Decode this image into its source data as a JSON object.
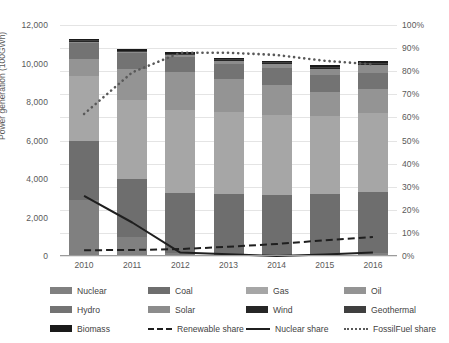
{
  "chart_data": {
    "type": "bar",
    "title": "",
    "subtitle": "",
    "xlabel": "",
    "ylabel": "Power generation (100GWh)",
    "y2label": "",
    "categories": [
      "2010",
      "2011",
      "2012",
      "2013",
      "2014",
      "2015",
      "2016"
    ],
    "ylim": [
      0,
      12000
    ],
    "yticks": [
      "0",
      "2,000",
      "4,000",
      "6,000",
      "8,000",
      "10,000",
      "12,000"
    ],
    "ytick_values": [
      0,
      2000,
      4000,
      6000,
      8000,
      10000,
      12000
    ],
    "y2lim": [
      0,
      100
    ],
    "y2ticks": [
      "0%",
      "10%",
      "20%",
      "30%",
      "40%",
      "50%",
      "60%",
      "70%",
      "80%",
      "90%",
      "100%"
    ],
    "y2tick_values": [
      0,
      10,
      20,
      30,
      40,
      50,
      60,
      70,
      80,
      90,
      100
    ],
    "grid": true,
    "legend_position": "bottom",
    "stacked": true,
    "series": [
      {
        "name": "Nuclear",
        "color": "#808080",
        "values": [
          2900,
          1000,
          150,
          90,
          0,
          90,
          180
        ]
      },
      {
        "name": "Coal",
        "color": "#6e6e6e",
        "values": [
          3050,
          3000,
          3100,
          3150,
          3150,
          3150,
          3150
        ]
      },
      {
        "name": "Gas",
        "color": "#a6a6a6",
        "values": [
          3400,
          4100,
          4350,
          4250,
          4200,
          4050,
          4100
        ]
      },
      {
        "name": "Oil",
        "color": "#949494",
        "values": [
          900,
          1600,
          1950,
          1700,
          1550,
          1250,
          1250
        ]
      },
      {
        "name": "Hydro",
        "color": "#737373",
        "values": [
          850,
          850,
          800,
          800,
          850,
          870,
          850
        ]
      },
      {
        "name": "Solar",
        "color": "#8c8c8c",
        "values": [
          35,
          50,
          80,
          150,
          230,
          320,
          400
        ]
      },
      {
        "name": "Wind",
        "color": "#262626",
        "values": [
          40,
          45,
          50,
          52,
          55,
          58,
          62
        ]
      },
      {
        "name": "Geothermal",
        "color": "#3f3f3f",
        "values": [
          26,
          27,
          26,
          26,
          26,
          26,
          26
        ]
      },
      {
        "name": "Biomass",
        "color": "#1a1a1a",
        "values": [
          60,
          65,
          70,
          75,
          80,
          85,
          90
        ]
      }
    ],
    "line_series": [
      {
        "name": "Renewable share",
        "style": "dashed",
        "color": "#1f1f1f",
        "unit": "%",
        "values": [
          2.5,
          2.6,
          3.0,
          4.0,
          5.2,
          6.8,
          8.2
        ]
      },
      {
        "name": "Nuclear share",
        "style": "solid",
        "color": "#1f1f1f",
        "unit": "%",
        "values": [
          26.0,
          14.5,
          1.5,
          0.8,
          0.0,
          0.6,
          1.5
        ]
      },
      {
        "name": "FossilFuel share",
        "style": "dotted",
        "color": "#595959",
        "unit": "%",
        "values": [
          61.5,
          79.5,
          88.0,
          88.0,
          87.0,
          84.5,
          83.0
        ]
      }
    ]
  },
  "legend": {
    "items": [
      {
        "label": "Nuclear",
        "kind": "swatch",
        "color": "#808080"
      },
      {
        "label": "Coal",
        "kind": "swatch",
        "color": "#6e6e6e"
      },
      {
        "label": "Gas",
        "kind": "swatch",
        "color": "#a6a6a6"
      },
      {
        "label": "Oil",
        "kind": "swatch",
        "color": "#949494"
      },
      {
        "label": "Hydro",
        "kind": "swatch",
        "color": "#737373"
      },
      {
        "label": "Solar",
        "kind": "swatch",
        "color": "#8c8c8c"
      },
      {
        "label": "Wind",
        "kind": "swatch",
        "color": "#262626"
      },
      {
        "label": "Geothermal",
        "kind": "swatch",
        "color": "#3f3f3f"
      },
      {
        "label": "Biomass",
        "kind": "swatch",
        "color": "#1a1a1a"
      },
      {
        "label": "Renewable share",
        "kind": "dashed",
        "color": "#1f1f1f"
      },
      {
        "label": "Nuclear share",
        "kind": "solid",
        "color": "#1f1f1f"
      },
      {
        "label": "FossilFuel share",
        "kind": "dotted",
        "color": "#595959"
      }
    ]
  },
  "style": {
    "background": "#ffffff",
    "grid_color": "#e4e4e4",
    "axis_color": "#9b9b9b",
    "text_color": "#595959"
  }
}
